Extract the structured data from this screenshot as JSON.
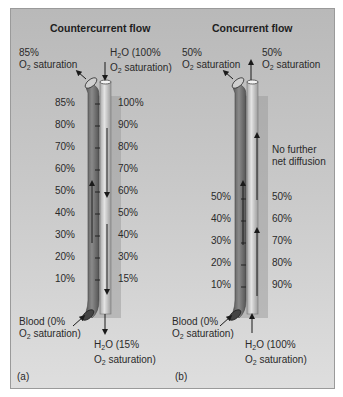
{
  "panels": [
    {
      "tag": "(a)",
      "title": "Countercurrent flow",
      "top_left_label": {
        "line1": "85%",
        "line2_pre": "O",
        "line2_sub": "2",
        "line2_post": " saturation"
      },
      "top_right_label": {
        "line1_pre": "H",
        "line1_sub": "2",
        "line1_post": "O (100%",
        "line2_pre": "O",
        "line2_sub": "2",
        "line2_post": " saturation)"
      },
      "bottom_left_label": {
        "line1": "Blood (0%",
        "line2_pre": "O",
        "line2_sub": "2",
        "line2_post": " saturation)"
      },
      "bottom_right_label": {
        "line1_pre": "H",
        "line1_sub": "2",
        "line1_post": "O (15%",
        "line2_pre": "O",
        "line2_sub": "2",
        "line2_post": " saturation)"
      },
      "blood_values": [
        "85%",
        "80%",
        "70%",
        "60%",
        "50%",
        "40%",
        "30%",
        "20%",
        "10%"
      ],
      "water_values": [
        "100%",
        "90%",
        "80%",
        "70%",
        "60%",
        "50%",
        "40%",
        "30%",
        "15%"
      ]
    },
    {
      "tag": "(b)",
      "title": "Concurrent flow",
      "top_left_label": {
        "line1": "50%",
        "line2_pre": "O",
        "line2_sub": "2",
        "line2_post": " saturation"
      },
      "top_right_label": {
        "line1": "50%",
        "line2_pre": "O",
        "line2_sub": "2",
        "line2_post": " saturation"
      },
      "bottom_left_label": {
        "line1": "Blood (0%",
        "line2_pre": "O",
        "line2_sub": "2",
        "line2_post": " saturation)"
      },
      "bottom_right_label": {
        "line1_pre": "H",
        "line1_sub": "2",
        "line1_post": "O (100%",
        "line2_pre": "O",
        "line2_sub": "2",
        "line2_post": " saturation)"
      },
      "annotation": {
        "line1": "No further",
        "line2": "net diffusion"
      },
      "blood_values": [
        "50%",
        "40%",
        "30%",
        "20%",
        "10%"
      ],
      "water_values": [
        "50%",
        "60%",
        "70%",
        "80%",
        "90%"
      ]
    }
  ],
  "colors": {
    "background_top": "#b9b9b9",
    "background_bottom": "#dedede",
    "blood_vessel": "#6f6f6f",
    "water_channel": "#d0d0d0",
    "arrow": "#1a1a1a",
    "text": "#2a2a2a"
  }
}
